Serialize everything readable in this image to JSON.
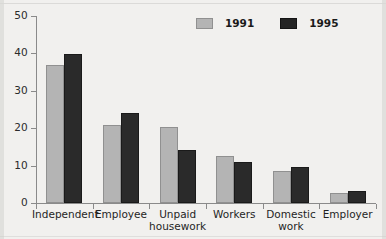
{
  "chart_data": {
    "type": "bar",
    "title": "",
    "subtitle": "",
    "xlabel": "",
    "ylabel": "",
    "ylim": [
      0,
      50
    ],
    "yticks": [
      0,
      10,
      20,
      30,
      40,
      50
    ],
    "ytick_labels": [
      "0",
      "10",
      "20",
      "30",
      "40",
      "50"
    ],
    "grid": false,
    "legend_position": "top-right",
    "categories": [
      "Independent",
      "Employee",
      "Unpaid housework",
      "Workers",
      "Domestic work",
      "Employer"
    ],
    "category_lines": [
      [
        "Independent"
      ],
      [
        "Employee"
      ],
      [
        "Unpaid",
        "housework"
      ],
      [
        "Workers"
      ],
      [
        "Domestic",
        "work"
      ],
      [
        "Employer"
      ]
    ],
    "series": [
      {
        "name": "1991",
        "color": "#b4b4b4",
        "values": [
          37,
          20.8,
          20.4,
          12.5,
          8.5,
          2.6
        ]
      },
      {
        "name": "1995",
        "color": "#242424",
        "values": [
          39.8,
          24.2,
          14.2,
          11,
          9.5,
          3.1
        ]
      }
    ]
  },
  "legend": {
    "items": [
      {
        "label": "1991",
        "swatch": "legend-swatch-1991"
      },
      {
        "label": "1995",
        "swatch": "legend-swatch-1995"
      }
    ]
  }
}
